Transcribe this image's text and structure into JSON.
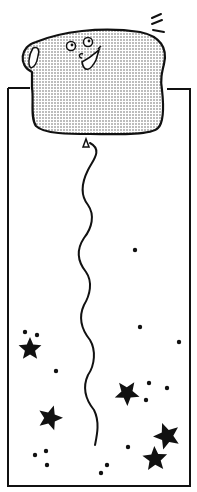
{
  "illustration": {
    "subject": "toast-balloon",
    "description": "Smiling slice of bread shaped like a balloon floating above a tall rectangular frame, its string trailing down among stars and dots",
    "colors": {
      "ink": "#111111",
      "background": "#ffffff",
      "bread_fill_dots": "#6a6a6a"
    },
    "frame": {
      "x": 8,
      "y": 88,
      "width": 182,
      "height": 398
    },
    "stars": [
      {
        "x": 30,
        "y": 349,
        "r": 12
      },
      {
        "x": 50,
        "y": 418,
        "r": 13
      },
      {
        "x": 127,
        "y": 393,
        "r": 13
      },
      {
        "x": 167,
        "y": 436,
        "r": 14
      },
      {
        "x": 155,
        "y": 459,
        "r": 13
      }
    ],
    "dots": [
      {
        "x": 25,
        "y": 332
      },
      {
        "x": 37,
        "y": 335
      },
      {
        "x": 56,
        "y": 371
      },
      {
        "x": 140,
        "y": 327
      },
      {
        "x": 179,
        "y": 342
      },
      {
        "x": 135,
        "y": 250
      },
      {
        "x": 149,
        "y": 383
      },
      {
        "x": 167,
        "y": 388
      },
      {
        "x": 146,
        "y": 400
      },
      {
        "x": 128,
        "y": 447
      },
      {
        "x": 46,
        "y": 451
      },
      {
        "x": 35,
        "y": 455
      },
      {
        "x": 47,
        "y": 465
      },
      {
        "x": 107,
        "y": 465
      },
      {
        "x": 101,
        "y": 473
      }
    ]
  }
}
